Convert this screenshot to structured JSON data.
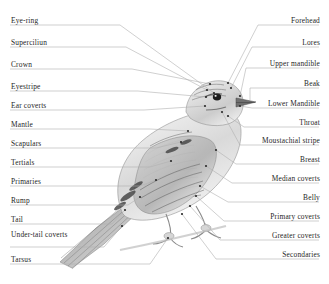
{
  "figure": {
    "type": "labelled-anatomy-diagram",
    "illustration_style": "pencil-sketch",
    "background_color": "#ffffff",
    "text_color": "#262626",
    "leader_line_color": "#b0b0b0"
  },
  "labels": {
    "left": [
      {
        "text": "Eye-ring",
        "y": 17,
        "rule_y": 25,
        "lines": 1
      },
      {
        "text": "Superciliun",
        "y": 39,
        "rule_y": 47,
        "lines": 1
      },
      {
        "text": "Crown",
        "y": 61,
        "rule_y": 69,
        "lines": 1
      },
      {
        "text": "Eyestripe",
        "y": 83,
        "rule_y": 91,
        "lines": 1
      },
      {
        "text": "Ear coverts",
        "y": 102,
        "rule_y": 110,
        "lines": 1
      },
      {
        "text": "Mantle",
        "y": 121,
        "rule_y": 129,
        "lines": 1
      },
      {
        "text": "Scapulars",
        "y": 140,
        "rule_y": 148,
        "lines": 1
      },
      {
        "text": "Tertials",
        "y": 159,
        "rule_y": 167,
        "lines": 1
      },
      {
        "text": "Primaries",
        "y": 178,
        "rule_y": 186,
        "lines": 1
      },
      {
        "text": "Rump",
        "y": 197,
        "rule_y": 205,
        "lines": 1
      },
      {
        "text": "Tail",
        "y": 216,
        "rule_y": 224,
        "lines": 1
      },
      {
        "text": "Under-tail coverts",
        "y": 231,
        "rule_y": 247,
        "lines": 2
      },
      {
        "text": "Tarsus",
        "y": 256,
        "rule_y": 264,
        "lines": 1
      }
    ],
    "right": [
      {
        "text": "Forehead",
        "y": 17,
        "rule_y": 25
      },
      {
        "text": "Lores",
        "y": 39,
        "rule_y": 47
      },
      {
        "text": "Upper mandible",
        "y": 60,
        "rule_y": 68
      },
      {
        "text": "Beak",
        "y": 80,
        "rule_y": 88
      },
      {
        "text": "Lower Mandible",
        "y": 100,
        "rule_y": 108
      },
      {
        "text": "Throat",
        "y": 119,
        "rule_y": 127
      },
      {
        "text": "Moustachial stripe",
        "y": 137,
        "rule_y": 145
      },
      {
        "text": "Breast",
        "y": 156,
        "rule_y": 164
      },
      {
        "text": "Median coverts",
        "y": 175,
        "rule_y": 183
      },
      {
        "text": "Belly",
        "y": 194,
        "rule_y": 202
      },
      {
        "text": "Primary coverts",
        "y": 213,
        "rule_y": 221
      },
      {
        "text": "Greater coverts",
        "y": 232,
        "rule_y": 240
      },
      {
        "text": "Secondaries",
        "y": 251,
        "rule_y": 259
      }
    ]
  }
}
